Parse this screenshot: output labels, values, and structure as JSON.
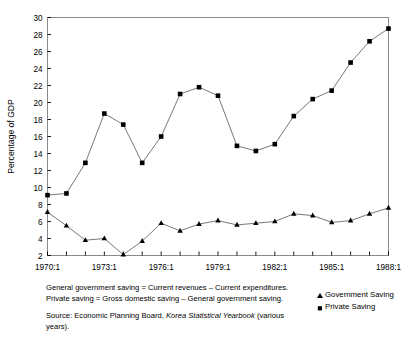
{
  "chart_data": {
    "type": "line",
    "title": "",
    "xlabel": "",
    "ylabel": "Percentage of GDP",
    "ylim": [
      2,
      30
    ],
    "ytick_step": 2,
    "yticks": [
      2,
      4,
      6,
      8,
      10,
      12,
      14,
      16,
      18,
      20,
      22,
      24,
      26,
      28,
      30
    ],
    "x": [
      1970,
      1971,
      1972,
      1973,
      1974,
      1975,
      1976,
      1977,
      1978,
      1979,
      1980,
      1981,
      1982,
      1983,
      1984,
      1985,
      1986,
      1987,
      1988
    ],
    "xtick_labels": [
      "1970:1",
      "1973:1",
      "1976:1",
      "1979:1",
      "1982:1",
      "1985:1",
      "1988:1"
    ],
    "xtick_values": [
      1970,
      1973,
      1976,
      1979,
      1982,
      1985,
      1988
    ],
    "xlim": [
      1970,
      1988
    ],
    "grid": false,
    "legend_position": "bottom-right",
    "series": [
      {
        "name": "Government Saving",
        "marker": "triangle",
        "color": "#000000",
        "values": [
          7.1,
          5.5,
          3.8,
          4.0,
          2.1,
          3.7,
          5.8,
          4.9,
          5.7,
          6.1,
          5.6,
          5.8,
          6.0,
          6.9,
          6.7,
          5.9,
          6.1,
          6.9,
          7.6
        ]
      },
      {
        "name": "Private Saving",
        "marker": "square",
        "color": "#000000",
        "values": [
          9.1,
          9.3,
          12.9,
          18.7,
          17.4,
          12.9,
          16.0,
          21.0,
          21.8,
          20.8,
          14.9,
          14.3,
          15.1,
          18.4,
          20.4,
          21.4,
          24.7,
          27.2,
          28.7
        ]
      }
    ]
  },
  "axes": {
    "ylabel": "Percentage of GDP"
  },
  "legend": {
    "items": [
      {
        "label": "Government Saving",
        "marker": "triangle"
      },
      {
        "label": "Private Saving",
        "marker": "square"
      }
    ]
  },
  "notes": {
    "line1": "General government saving = Current revenues – Current expenditures.",
    "line2": "Private saving = Gross domestic saving – General government saving.",
    "source_prefix": "Source: Economic Planning Board, ",
    "source_italic": "Korea Statistical Yearbook",
    "source_suffix": " (various years)."
  }
}
